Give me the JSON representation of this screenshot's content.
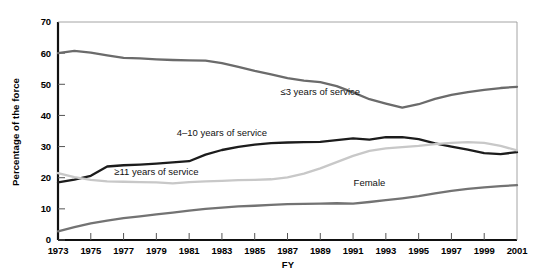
{
  "chart_data": {
    "type": "line",
    "title": "",
    "xlabel": "FY",
    "ylabel": "Percentage of the force",
    "xlim": [
      1973,
      2001
    ],
    "ylim": [
      0,
      70
    ],
    "grid": false,
    "legend_position": "inline-annotations",
    "x": [
      1973,
      1974,
      1975,
      1976,
      1977,
      1978,
      1979,
      1980,
      1981,
      1982,
      1983,
      1984,
      1985,
      1986,
      1987,
      1988,
      1989,
      1990,
      1991,
      1992,
      1993,
      1994,
      1995,
      1996,
      1997,
      1998,
      1999,
      2000,
      2001
    ],
    "xticks": [
      1973,
      1975,
      1977,
      1979,
      1981,
      1983,
      1985,
      1987,
      1989,
      1991,
      1993,
      1995,
      1997,
      1999,
      2001
    ],
    "xticklabels": [
      "1973",
      "1975",
      "1977",
      "1979",
      "1981",
      "1983",
      "1985",
      "1987",
      "1989",
      "1991",
      "1993",
      "1995",
      "1997",
      "1999",
      "2001"
    ],
    "yticks": [
      0,
      10,
      20,
      30,
      40,
      50,
      60,
      70
    ],
    "yticklabels": [
      "0",
      "10",
      "20",
      "30",
      "40",
      "50",
      "60",
      "70"
    ],
    "series": [
      {
        "name": "≤3 years of service",
        "color": "#6b6b6b",
        "label_x": 1989,
        "label_y": 46.5,
        "values": [
          60.0,
          60.7,
          60.2,
          59.3,
          58.5,
          58.3,
          58.0,
          57.8,
          57.7,
          57.6,
          56.8,
          55.6,
          54.3,
          53.2,
          52.0,
          51.2,
          50.7,
          49.4,
          47.4,
          45.2,
          43.8,
          42.5,
          43.6,
          45.3,
          46.6,
          47.5,
          48.2,
          48.8,
          49.2
        ]
      },
      {
        "name": "4–10 years of service",
        "color": "#1c1c1c",
        "label_x": 1983,
        "label_y": 33.5,
        "values": [
          18.5,
          19.4,
          20.6,
          23.6,
          24.0,
          24.2,
          24.5,
          24.9,
          25.3,
          27.4,
          28.9,
          29.9,
          30.6,
          31.1,
          31.3,
          31.4,
          31.5,
          32.1,
          32.6,
          32.2,
          33.0,
          33.0,
          32.4,
          31.0,
          30.0,
          29.0,
          27.9,
          27.6,
          28.2
        ]
      },
      {
        "name": "≥11 years of service",
        "color": "#c8c8c8",
        "label_x": 1979,
        "label_y": 21.0,
        "values": [
          21.5,
          20.2,
          19.3,
          18.8,
          18.7,
          18.6,
          18.5,
          18.2,
          18.6,
          18.8,
          19.0,
          19.2,
          19.3,
          19.5,
          20.1,
          21.3,
          23.0,
          25.0,
          27.0,
          28.6,
          29.4,
          29.8,
          30.2,
          30.8,
          31.2,
          31.4,
          31.2,
          30.2,
          28.8
        ]
      },
      {
        "name": "Female",
        "color": "#737373",
        "label_x": 1992,
        "label_y": 17.2,
        "values": [
          2.8,
          4.1,
          5.3,
          6.2,
          7.0,
          7.6,
          8.2,
          8.8,
          9.4,
          10.0,
          10.4,
          10.8,
          11.0,
          11.3,
          11.5,
          11.6,
          11.7,
          11.8,
          11.7,
          12.2,
          12.8,
          13.4,
          14.1,
          15.0,
          15.8,
          16.4,
          16.9,
          17.3,
          17.6
        ]
      }
    ]
  },
  "axes": {
    "y_axis_title": "Percentage of the force",
    "x_axis_title": "FY"
  }
}
